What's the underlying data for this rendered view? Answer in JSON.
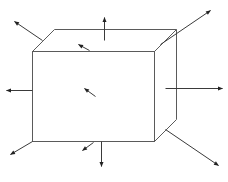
{
  "diagram": {
    "colors": {
      "edge": "#5a5a5a",
      "arrow": "#3a3a3a",
      "background": "#ffffff"
    },
    "cube": {
      "front_face": {
        "x1": 32,
        "y1": 51,
        "x2": 154,
        "y2": 141
      },
      "back_offset": {
        "dx": 22,
        "dy": -22
      }
    },
    "arrows": [
      {
        "name": "normal-top-left-edge",
        "from": [
          42,
          40
        ],
        "to": [
          14,
          21
        ]
      },
      {
        "name": "normal-top-face",
        "from": [
          104,
          40
        ],
        "to": [
          104,
          17
        ]
      },
      {
        "name": "normal-top-face-inner",
        "from": [
          89,
          50
        ],
        "to": [
          78,
          44
        ]
      },
      {
        "name": "normal-top-right-corner",
        "from": [
          160,
          44
        ],
        "to": [
          210,
          10
        ]
      },
      {
        "name": "normal-left-face",
        "from": [
          32,
          90
        ],
        "to": [
          6,
          90
        ]
      },
      {
        "name": "normal-front-face-inner",
        "from": [
          95,
          96
        ],
        "to": [
          84,
          88
        ]
      },
      {
        "name": "normal-right-face",
        "from": [
          165,
          88
        ],
        "to": [
          222,
          88
        ]
      },
      {
        "name": "normal-bottom-left-corner",
        "from": [
          32,
          141
        ],
        "to": [
          10,
          154
        ]
      },
      {
        "name": "normal-bottom-front-inner",
        "from": [
          93,
          142
        ],
        "to": [
          82,
          150
        ]
      },
      {
        "name": "normal-bottom-face",
        "from": [
          101,
          141
        ],
        "to": [
          101,
          166
        ]
      },
      {
        "name": "normal-bottom-right-edge",
        "from": [
          165,
          129
        ],
        "to": [
          218,
          165
        ]
      }
    ]
  }
}
